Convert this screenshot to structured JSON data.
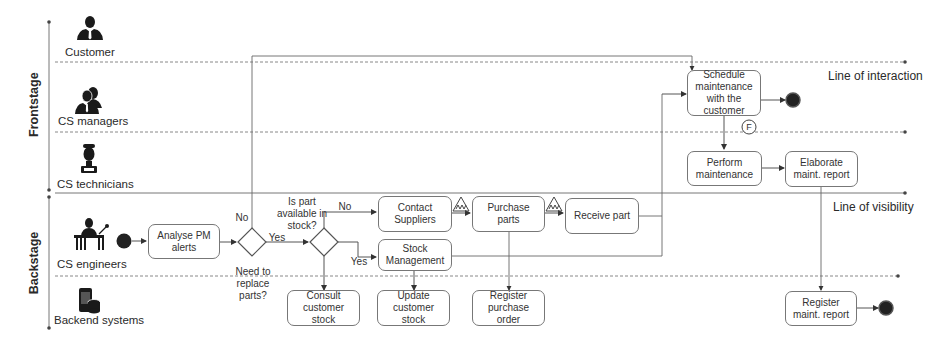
{
  "stages": {
    "frontstage": "Frontstage",
    "backstage": "Backstage"
  },
  "lanes": [
    {
      "label": "Customer",
      "icon": "customer-icon"
    },
    {
      "label": "CS managers",
      "icon": "managers-icon"
    },
    {
      "label": "CS technicians",
      "icon": "technician-icon"
    },
    {
      "label": "CS engineers",
      "icon": "engineer-icon"
    },
    {
      "label": "Backend systems",
      "icon": "backend-systems-icon"
    }
  ],
  "lines": {
    "interaction": "Line of interaction",
    "visibility": "Line of visibility"
  },
  "activities": {
    "analyse": "Analyse PM\nalerts",
    "contact": "Contact\nSuppliers",
    "stock_mgmt": "Stock\nManagement",
    "purchase": "Purchase\nparts",
    "receive": "Receive part",
    "schedule": "Schedule\nmaintenance\nwith the\ncustomer",
    "perform": "Perform\nmaintenance",
    "elaborate": "Elaborate\nmaint. report",
    "consult": "Consult\ncustomer\nstock",
    "update": "Update\ncustomer\nstock",
    "register_po": "Register\npurchase\norder",
    "register_report": "Register\nmaint. report"
  },
  "gateways": {
    "replace_question": "Need to\nreplace\nparts?",
    "stock_question": "Is part\navailable in\nstock?",
    "no1": "No",
    "yes1": "Yes",
    "no2": "No",
    "yes2": "Yes"
  },
  "markers": {
    "feedback": "F"
  }
}
